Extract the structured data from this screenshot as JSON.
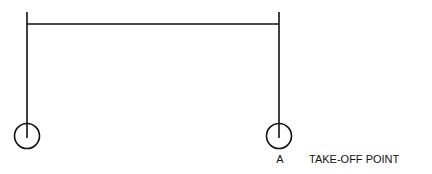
{
  "diagram": {
    "type": "take-off point schematic",
    "stroke_color": "#111111",
    "background": "#ffffff",
    "points": [
      {
        "id": "left-point",
        "label": "",
        "cx": 27,
        "cy": 136,
        "r": 13
      },
      {
        "id": "point-a",
        "label": "A",
        "cx": 279,
        "cy": 136,
        "r": 13
      }
    ],
    "crossbar": {
      "x1": 27,
      "x2": 279,
      "y": 24
    },
    "verticals": [
      {
        "x": 27,
        "y1": 12,
        "y2": 138
      },
      {
        "x": 279,
        "y1": 12,
        "y2": 138
      }
    ],
    "annotation": "TAKE-OFF POINT"
  }
}
